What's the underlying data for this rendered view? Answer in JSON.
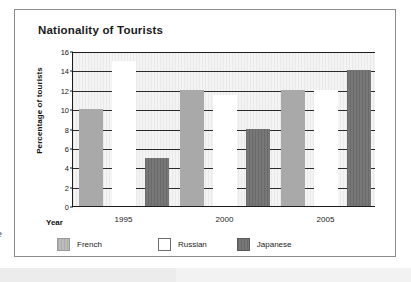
{
  "card": {
    "title": "Nationality of Tourists"
  },
  "margin_glyph": "e",
  "legend": {
    "items": [
      {
        "label": "French",
        "color": "#a9a9a9",
        "key": "french"
      },
      {
        "label": "Russian",
        "color": "#ffffff",
        "key": "russian"
      },
      {
        "label": "Japanese",
        "color": "#6a6a6a",
        "key": "japanese"
      }
    ]
  },
  "chart_data": {
    "type": "bar",
    "title": "Nationality of Tourists",
    "xlabel": "Year",
    "ylabel": "Percentage of tourists",
    "categories": [
      "1995",
      "2000",
      "2005"
    ],
    "series": [
      {
        "name": "French",
        "color": "#a9a9a9",
        "values": [
          10,
          12,
          12
        ]
      },
      {
        "name": "Russian",
        "color": "#ffffff",
        "values": [
          15,
          11.5,
          12
        ]
      },
      {
        "name": "Japanese",
        "color": "#6a6a6a",
        "values": [
          5,
          8,
          14
        ]
      }
    ],
    "ylim": [
      0,
      16
    ],
    "yticks": [
      0,
      2,
      4,
      6,
      8,
      10,
      12,
      14,
      16
    ],
    "ytick_labels": [
      "0",
      "2",
      "4",
      "6",
      "8",
      "10",
      "12",
      "14",
      "16"
    ],
    "grid": true,
    "grid_axis": "y",
    "legend_position": "bottom-left",
    "plot_background": "#eeeeee"
  }
}
